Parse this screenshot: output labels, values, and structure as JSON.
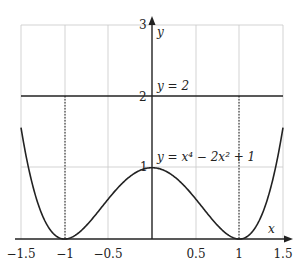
{
  "chart_data": {
    "type": "line",
    "title": "",
    "xlabel": "x",
    "ylabel": "y",
    "xlim": [
      -1.5,
      1.5
    ],
    "ylim": [
      0,
      3
    ],
    "grid": true,
    "x_ticks": [
      "−1.5",
      "−1",
      "−0.5",
      "0.5",
      "1",
      "1.5"
    ],
    "y_ticks": [
      "1",
      "2",
      "3"
    ],
    "series": [
      {
        "name": "y = x⁴ − 2x² + 1",
        "function": "x^4 - 2x^2 + 1",
        "x": [
          -1.5,
          -1.25,
          -1.0,
          -0.75,
          -0.5,
          -0.25,
          0,
          0.25,
          0.5,
          0.75,
          1.0,
          1.25,
          1.5
        ],
        "values": [
          1.5625,
          0.3164,
          0,
          0.1914,
          0.5625,
          0.8789,
          1,
          0.8789,
          0.5625,
          0.1914,
          0,
          0.3164,
          1.5625
        ]
      },
      {
        "name": "y = 2",
        "function": "2",
        "x": [
          -1.5,
          1.5
        ],
        "values": [
          2,
          2
        ]
      }
    ],
    "annotations": [
      {
        "text": "y = 2",
        "x": 0.05,
        "y": 2.1
      },
      {
        "text": "y = x⁴ − 2x² + 1",
        "x": 0.05,
        "y": 1.1
      },
      {
        "text": "dotted vertical line at x = −1 from y=0 to y=2"
      },
      {
        "text": "dotted vertical line at x = 1 from y=0 to y=2"
      }
    ]
  },
  "labels": {
    "x_axis": "x",
    "y_axis": "y",
    "line_label": "y = 2",
    "curve_label": "y = x⁴ − 2x² + 1",
    "tick_y3": "3",
    "tick_y2": "2",
    "tick_y1": "1",
    "tick_xm15": "−1.5",
    "tick_xm1": "−1",
    "tick_xm05": "−0.5",
    "tick_x05": "0.5",
    "tick_x1": "1",
    "tick_x15": "1.5"
  }
}
